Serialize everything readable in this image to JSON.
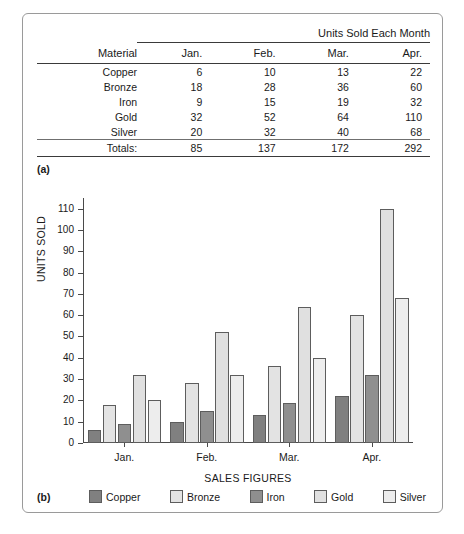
{
  "figure": {
    "part_a_caption": "(a)",
    "part_b_caption": "(b)"
  },
  "table": {
    "span_header": "Units Sold Each Month",
    "material_header": "Material",
    "month_headers": [
      "Jan.",
      "Feb.",
      "Mar.",
      "Apr."
    ],
    "rows": [
      {
        "material": "Copper",
        "values": [
          "6",
          "10",
          "13",
          "22"
        ]
      },
      {
        "material": "Bronze",
        "values": [
          "18",
          "28",
          "36",
          "60"
        ]
      },
      {
        "material": "Iron",
        "values": [
          "9",
          "15",
          "19",
          "32"
        ]
      },
      {
        "material": "Gold",
        "values": [
          "32",
          "52",
          "64",
          "110"
        ]
      },
      {
        "material": "Silver",
        "values": [
          "20",
          "32",
          "40",
          "68"
        ]
      }
    ],
    "totals_label": "Totals:",
    "totals": [
      "85",
      "137",
      "172",
      "292"
    ]
  },
  "chart_data": {
    "type": "bar",
    "title": "",
    "xlabel": "SALES FIGURES",
    "ylabel": "UNITS SOLD",
    "categories": [
      "Jan.",
      "Feb.",
      "Mar.",
      "Apr."
    ],
    "series": [
      {
        "name": "Copper",
        "values": [
          6,
          10,
          13,
          22
        ],
        "color": "#808080"
      },
      {
        "name": "Bronze",
        "values": [
          18,
          28,
          36,
          60
        ],
        "color": "#e3e3e3"
      },
      {
        "name": "Iron",
        "values": [
          9,
          15,
          19,
          32
        ],
        "color": "#8f8f8f"
      },
      {
        "name": "Gold",
        "values": [
          32,
          52,
          64,
          110
        ],
        "color": "#e0e0e0"
      },
      {
        "name": "Silver",
        "values": [
          20,
          32,
          40,
          68
        ],
        "color": "#ededed"
      }
    ],
    "ylim": [
      0,
      115
    ],
    "yticks": [
      0,
      10,
      20,
      30,
      40,
      50,
      60,
      70,
      80,
      90,
      100,
      110
    ],
    "ytick_labels": [
      "0",
      "10",
      "20",
      "30",
      "40",
      "50",
      "60",
      "70",
      "80",
      "90",
      "100",
      "110"
    ],
    "grid": false,
    "legend_position": "bottom"
  }
}
